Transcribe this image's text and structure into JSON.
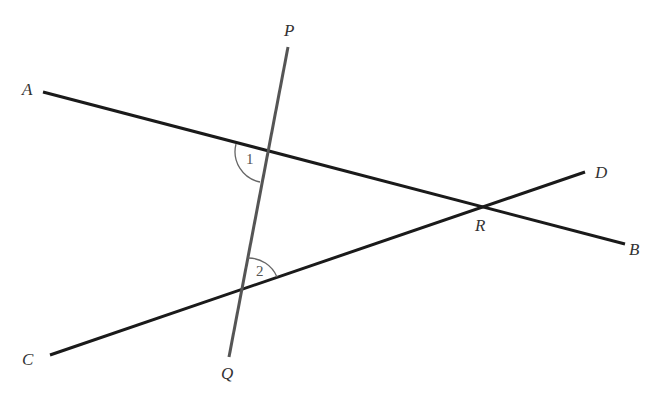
{
  "diagram": {
    "type": "geometry-intersecting-lines",
    "points": {
      "A": {
        "label": "A",
        "x": 43,
        "y": 92,
        "label_x": 22,
        "label_y": 95
      },
      "B": {
        "label": "B",
        "x": 625,
        "y": 244,
        "label_x": 629,
        "label_y": 255
      },
      "C": {
        "label": "C",
        "x": 50,
        "y": 355,
        "label_x": 22,
        "label_y": 365
      },
      "D": {
        "label": "D",
        "x": 585,
        "y": 172,
        "label_x": 595,
        "label_y": 178
      },
      "P": {
        "label": "P",
        "x": 288,
        "y": 47,
        "label_x": 285,
        "label_y": 36
      },
      "Q": {
        "label": "Q",
        "x": 229,
        "y": 357,
        "label_x": 221,
        "label_y": 379
      },
      "R": {
        "label": "R",
        "x": 480,
        "y": 206,
        "label_x": 475,
        "label_y": 231
      }
    },
    "lines": [
      {
        "name": "AB",
        "from": "A",
        "to": "B",
        "color": "#1a1a1a",
        "width": 3
      },
      {
        "name": "CD",
        "from": "C",
        "to": "D",
        "color": "#1a1a1a",
        "width": 3
      },
      {
        "name": "PQ",
        "from": "P",
        "to": "Q",
        "color": "#555555",
        "width": 3
      }
    ],
    "angles": [
      {
        "label": "2",
        "vertex": "PQ∩AB",
        "label_x": 246,
        "label_y": 164
      },
      {
        "label": "1",
        "vertex": "PQ∩CD",
        "label_x": 256,
        "label_y": 275
      }
    ]
  }
}
